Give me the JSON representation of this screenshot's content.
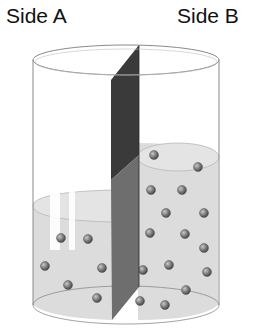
{
  "labels": {
    "side_a": "Side A",
    "side_b": "Side B"
  },
  "diagram": {
    "colors": {
      "liquid": "#dcdcdc",
      "membrane_dark": "#3a3a3a",
      "membrane_mid": "#6e6e6e",
      "particle": "#7a7a7a",
      "outline": "#8a8a8a"
    },
    "particles_side_a": [
      [
        61,
        238
      ],
      [
        88,
        239
      ],
      [
        45,
        266
      ],
      [
        102,
        268
      ],
      [
        68,
        285
      ],
      [
        97,
        298
      ]
    ],
    "particles_side_b": [
      [
        154,
        155
      ],
      [
        198,
        167
      ],
      [
        151,
        190
      ],
      [
        182,
        190
      ],
      [
        166,
        213
      ],
      [
        204,
        213
      ],
      [
        150,
        233
      ],
      [
        185,
        234
      ],
      [
        204,
        248
      ],
      [
        169,
        265
      ],
      [
        207,
        272
      ],
      [
        143,
        270
      ],
      [
        186,
        290
      ],
      [
        140,
        301
      ],
      [
        165,
        305
      ]
    ]
  }
}
